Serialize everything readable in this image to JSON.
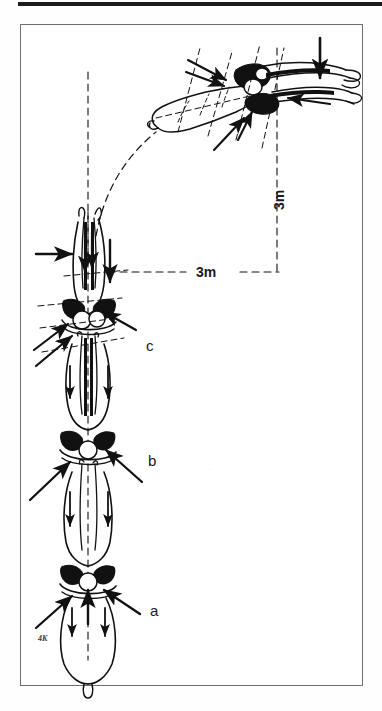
{
  "figure": {
    "caption_present": false,
    "stage_labels": [
      {
        "id": "a",
        "text": "a"
      },
      {
        "id": "b",
        "text": "b"
      },
      {
        "id": "c",
        "text": "c"
      }
    ],
    "distance_labels": [
      {
        "id": "horizontal",
        "text": "3m",
        "orientation": "horizontal"
      },
      {
        "id": "vertical",
        "text": "3m",
        "orientation": "vertical"
      }
    ],
    "signature": {
      "text": "4K"
    },
    "colors": {
      "ink": "#111111",
      "frame": "#6f6f6f",
      "paper": "#ffffff",
      "rule": "#1b1b1b"
    }
  }
}
